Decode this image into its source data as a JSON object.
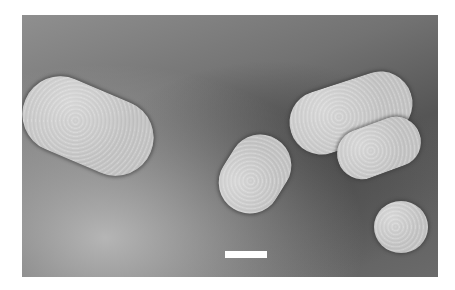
{
  "image": {
    "type": "electron-micrograph",
    "background_color": "#6e6e6e",
    "particle_color": "#c8c8c8",
    "scale_bar_color": "#ffffff"
  },
  "particles": [
    {
      "shape": "rod",
      "x": 0,
      "y": 66,
      "w": 134,
      "h": 80,
      "rotate": 23
    },
    {
      "shape": "rod",
      "x": 268,
      "y": 62,
      "w": 124,
      "h": 68,
      "rotate": -18
    },
    {
      "shape": "rod",
      "x": 316,
      "y": 104,
      "w": 86,
      "h": 54,
      "rotate": -20
    },
    {
      "shape": "rod",
      "x": 195,
      "y": 113,
      "w": 78,
      "h": 72,
      "rotate": -55
    },
    {
      "shape": "round",
      "x": 351,
      "y": 185,
      "w": 54,
      "h": 54,
      "rotate": 0
    }
  ],
  "scale_bar": {
    "x": 203,
    "y": 235,
    "w": 41,
    "h": 7
  }
}
